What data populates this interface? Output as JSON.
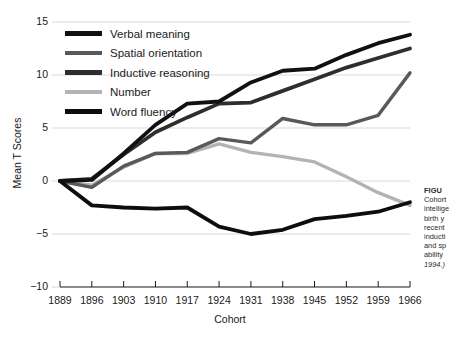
{
  "chart_data": {
    "type": "line",
    "title": "",
    "xlabel": "Cohort",
    "ylabel": "Mean T Scores",
    "categories": [
      1889,
      1896,
      1903,
      1910,
      1917,
      1924,
      1931,
      1938,
      1945,
      1952,
      1959,
      1966
    ],
    "xlim": [
      1889,
      1966
    ],
    "ylim": [
      -10,
      15
    ],
    "yticks": [
      15,
      10,
      5,
      0,
      -5,
      -10
    ],
    "ytick_labels": [
      "15",
      "10",
      "5",
      "0",
      "−5",
      "−10"
    ],
    "xtick_labels": [
      "1889",
      "1896",
      "1903",
      "1910",
      "1917",
      "1924",
      "1931",
      "1938",
      "1945",
      "1952",
      "1959",
      "1966"
    ],
    "grid": "horizontal",
    "legend_position": "top-left-inside",
    "series": [
      {
        "name": "Verbal meaning",
        "color": "#111111",
        "values": [
          0,
          0.1,
          2.6,
          5.3,
          7.3,
          7.5,
          9.3,
          10.4,
          10.6,
          11.9,
          13.0,
          13.8
        ]
      },
      {
        "name": "Spatial orientation",
        "color": "#595959",
        "values": [
          0,
          -0.6,
          1.4,
          2.6,
          2.7,
          4.0,
          3.6,
          5.9,
          5.3,
          5.3,
          6.2,
          10.2
        ]
      },
      {
        "name": "Inductive reasoning",
        "color": "#2e2e2e",
        "values": [
          0,
          0.2,
          2.5,
          4.6,
          6.0,
          7.3,
          7.4,
          8.5,
          9.6,
          10.7,
          11.6,
          12.5
        ]
      },
      {
        "name": "Number",
        "color": "#b3b3b3",
        "values": [
          0,
          -0.4,
          1.3,
          2.6,
          2.6,
          3.5,
          2.7,
          2.3,
          1.8,
          0.4,
          -1.1,
          -2.3
        ]
      },
      {
        "name": "Word fluency",
        "color": "#0d0d0d",
        "values": [
          0,
          -2.3,
          -2.5,
          -2.6,
          -2.5,
          -4.3,
          -5.0,
          -4.6,
          -3.6,
          -3.3,
          -2.9,
          -2.0
        ]
      }
    ]
  },
  "legend": {
    "items": [
      {
        "label": "Verbal meaning",
        "color": "#111111",
        "thickness": 5
      },
      {
        "label": "Spatial orientation",
        "color": "#595959",
        "thickness": 4
      },
      {
        "label": "Inductive reasoning",
        "color": "#2e2e2e",
        "thickness": 5
      },
      {
        "label": "Number",
        "color": "#b3b3b3",
        "thickness": 4
      },
      {
        "label": "Word fluency",
        "color": "#0d0d0d",
        "thickness": 5
      }
    ]
  },
  "caption": {
    "title": "FIGU",
    "lines": [
      "Cohort",
      "intellige",
      "birth y",
      "recent",
      "inducti",
      "and sp",
      "ability"
    ],
    "cite": "1994.)"
  },
  "style": {
    "grid_color": "#d9d9d9",
    "axis_color": "#1a1a1a",
    "background": "#ffffff"
  }
}
